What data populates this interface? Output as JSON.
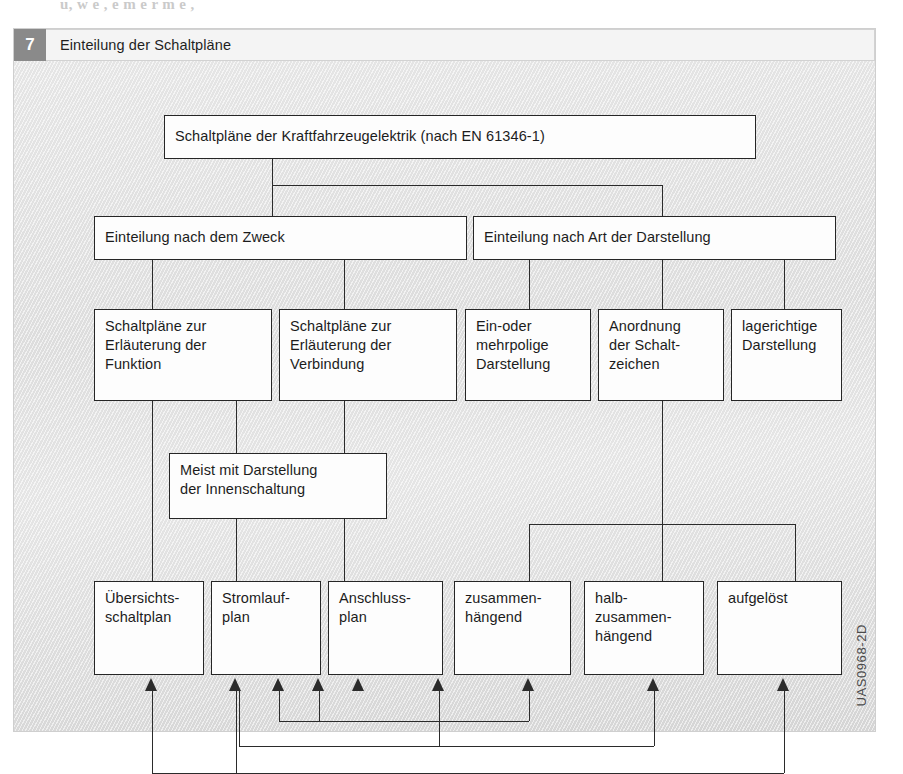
{
  "page": {
    "bleed_text": "u,                    w e ,         e m  e r  m e ,",
    "side_code": "UAS0968-2D"
  },
  "caption": {
    "number": "7",
    "title": "Einteilung der Schaltpläne"
  },
  "diagram": {
    "type": "tree-hierarchy",
    "root": {
      "id": "root",
      "label": "Schaltpläne der Kraftfahrzeugelektrik (nach EN 61346-1)"
    },
    "level2": [
      {
        "id": "zweck",
        "label": "Einteilung nach dem Zweck"
      },
      {
        "id": "darstellung",
        "label": "Einteilung nach Art der Darstellung"
      }
    ],
    "level3": [
      {
        "id": "funktion",
        "label": "Schaltpläne zur\nErläuterung der\nFunktion"
      },
      {
        "id": "verbindung",
        "label": "Schaltpläne zur\nErläuterung der\nVerbindung"
      },
      {
        "id": "polig",
        "label": "Ein-oder\nmehrpolige\nDarstellung"
      },
      {
        "id": "anordnung",
        "label": "Anordnung\nder Schalt-\nzeichen"
      },
      {
        "id": "lagericht",
        "label": "lagerichtige\nDarstellung"
      }
    ],
    "level4": [
      {
        "id": "innen",
        "label": "Meist mit Darstellung\nder Innenschaltung"
      }
    ],
    "level5": [
      {
        "id": "uebersicht",
        "label": "Übersichts-\nschaltplan"
      },
      {
        "id": "stromlauf",
        "label": "Stromlauf-\nplan"
      },
      {
        "id": "anschluss",
        "label": "Anschluss-\nplan"
      },
      {
        "id": "zusammen",
        "label": "zusammen-\nhängend"
      },
      {
        "id": "halb",
        "label": "halb-\nzusammen-\nhängend"
      },
      {
        "id": "aufgeloest",
        "label": "aufgelöst"
      }
    ]
  },
  "colors": {
    "panel_background": "#e3e3e3",
    "node_fill": "#fdfdfd",
    "node_border": "#262626",
    "figure_number_background": "#8a8a8a",
    "caption_field_background": "#f4f4f4"
  }
}
